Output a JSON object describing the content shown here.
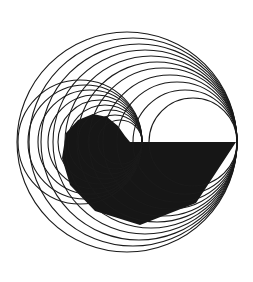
{
  "artwork": {
    "background": "#ffffff",
    "stroke_color": "#1a1a1a",
    "fill_color": "#161616",
    "large_family": {
      "tangent_point": [
        237,
        142
      ],
      "radii": [
        110,
        104,
        98,
        92,
        86,
        80,
        74,
        67,
        60,
        52,
        44
      ],
      "vertical_offsets": [
        0,
        4,
        6,
        8,
        9,
        10,
        10,
        9,
        7,
        5,
        2
      ]
    },
    "small_family": {
      "tangent_point": [
        142,
        142
      ],
      "radii": [
        62,
        57,
        52,
        47,
        42,
        37,
        32,
        27,
        22
      ],
      "vertical_offsets": [
        0,
        0,
        0,
        0,
        0,
        0,
        0,
        0,
        0
      ]
    },
    "polygon": [
      [
        93,
        114
      ],
      [
        107,
        117
      ],
      [
        118,
        126
      ],
      [
        125,
        136
      ],
      [
        130,
        142
      ],
      [
        236,
        142
      ],
      [
        196,
        203
      ],
      [
        140,
        225
      ],
      [
        95,
        211
      ],
      [
        70,
        185
      ],
      [
        62,
        158
      ],
      [
        66,
        133
      ],
      [
        78,
        120
      ]
    ]
  }
}
